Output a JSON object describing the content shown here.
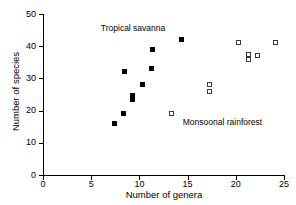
{
  "chart_data": {
    "type": "scatter",
    "title": "",
    "xlabel": "Number of genera",
    "ylabel": "Number of species",
    "xlim": [
      0,
      25
    ],
    "ylim": [
      0,
      50
    ],
    "xticks": [
      0,
      5,
      10,
      15,
      20,
      25
    ],
    "yticks": [
      0,
      10,
      20,
      30,
      40,
      50
    ],
    "xtick_labels": [
      "0",
      "5",
      "10",
      "15",
      "20",
      "25"
    ],
    "ytick_labels": [
      "0",
      "10",
      "20",
      "30",
      "40",
      "50"
    ],
    "grid": false,
    "legend": "none",
    "annotations": [
      {
        "text": "Tropical savanna",
        "x": 6.0,
        "y": 45.5
      },
      {
        "text": "Monsoonal rainforest",
        "x": 14.5,
        "y": 16.5
      }
    ],
    "series": [
      {
        "name": "Tropical savanna",
        "marker": "filled-square",
        "color": "#000000",
        "points": [
          {
            "x": 7.4,
            "y": 16
          },
          {
            "x": 8.4,
            "y": 19
          },
          {
            "x": 8.5,
            "y": 32
          },
          {
            "x": 9.3,
            "y": 23.3
          },
          {
            "x": 9.3,
            "y": 24.8
          },
          {
            "x": 10.3,
            "y": 28
          },
          {
            "x": 11.3,
            "y": 33
          },
          {
            "x": 11.4,
            "y": 39
          },
          {
            "x": 14.4,
            "y": 42
          }
        ]
      },
      {
        "name": "Monsoonal rainforest",
        "marker": "open-square",
        "color": "#3a3a3a",
        "points": [
          {
            "x": 13.3,
            "y": 19
          },
          {
            "x": 17.3,
            "y": 26
          },
          {
            "x": 17.3,
            "y": 28
          },
          {
            "x": 20.3,
            "y": 41
          },
          {
            "x": 21.3,
            "y": 35.8
          },
          {
            "x": 21.3,
            "y": 37.4
          },
          {
            "x": 22.2,
            "y": 37
          },
          {
            "x": 24.1,
            "y": 41
          }
        ]
      }
    ]
  }
}
